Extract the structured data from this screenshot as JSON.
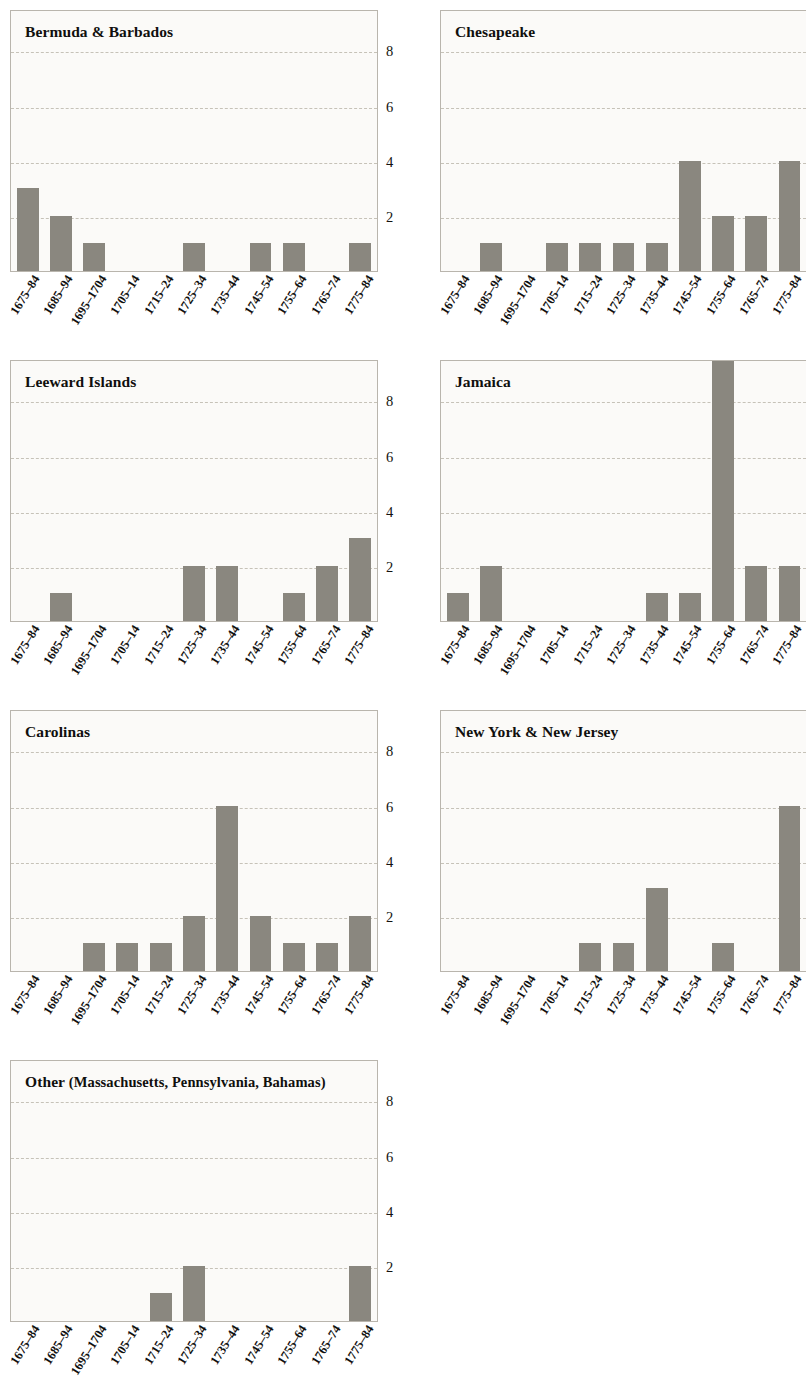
{
  "figure": {
    "axis_max": 9.5,
    "bar_color": "#8a877f",
    "grid_color": "#c6c2b8",
    "panel_bg": "#fbfaf8",
    "panel_border": "#b9b5ad"
  },
  "chart_data": {
    "type": "bar",
    "title": "",
    "xlabel": "",
    "ylabel": "",
    "ylim": [
      0,
      9.5
    ],
    "yticks": [
      2,
      4,
      6,
      8
    ],
    "grid": true,
    "legend": "none",
    "layout": "small-multiples 2 columns x 4 rows (7 panels)",
    "categories": [
      "1675–84",
      "1685–94",
      "1695–1704",
      "1705–14",
      "1715–24",
      "1725–34",
      "1735–44",
      "1745–54",
      "1755–64",
      "1765–74",
      "1775–84"
    ],
    "panels": [
      {
        "title": "Bermuda & Barbados",
        "values": [
          3,
          2,
          1,
          0,
          0,
          1,
          0,
          1,
          1,
          0,
          1
        ]
      },
      {
        "title": "Chesapeake",
        "values": [
          0,
          1,
          0,
          1,
          1,
          1,
          1,
          4,
          2,
          2,
          4
        ]
      },
      {
        "title": "Leeward Islands",
        "values": [
          0,
          1,
          0,
          0,
          0,
          2,
          2,
          0,
          1,
          2,
          3
        ]
      },
      {
        "title": "Jamaica",
        "values": [
          1,
          2,
          0,
          0,
          0,
          0,
          1,
          1,
          11,
          2,
          2
        ],
        "note": "1755–64 bar is clipped at top of panel"
      },
      {
        "title": "Carolinas",
        "values": [
          0,
          0,
          1,
          1,
          1,
          2,
          6,
          2,
          1,
          1,
          2
        ]
      },
      {
        "title": "New York & New Jersey",
        "values": [
          0,
          0,
          0,
          0,
          1,
          1,
          3,
          0,
          1,
          0,
          6
        ]
      },
      {
        "title": "Other (Massachusetts, Pennsylvania, Bahamas)",
        "title_main": "Other",
        "title_sub": "(Massachusetts, Pennsylvania, Bahamas)",
        "values": [
          0,
          0,
          0,
          0,
          1,
          2,
          0,
          0,
          0,
          0,
          2
        ]
      }
    ]
  }
}
